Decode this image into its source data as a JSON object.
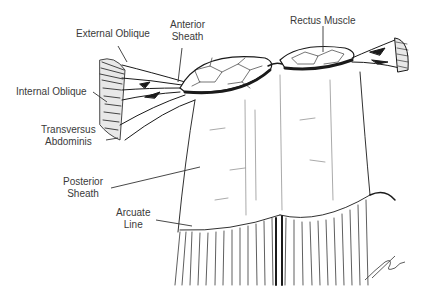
{
  "figure": {
    "style": "pen-and-ink line drawing",
    "colors": {
      "ink": "#1a1a1a",
      "label_text": "#3a3a3a",
      "background": "#ffffff"
    }
  },
  "labels": {
    "external_oblique": {
      "text": "External Oblique"
    },
    "anterior_sheath": {
      "line1": "Anterior",
      "line2": "Sheath"
    },
    "rectus_muscle": {
      "text": "Rectus Muscle"
    },
    "internal_oblique": {
      "text": "Internal Oblique"
    },
    "transversus_abdominis": {
      "line1": "Transversus",
      "line2": "Abdominis"
    },
    "posterior_sheath": {
      "line1": "Posterior",
      "line2": "Sheath"
    },
    "arcuate_line": {
      "line1": "Arcuate",
      "line2": "Line"
    }
  },
  "signature": {
    "present": true,
    "position": "bottom-right"
  }
}
